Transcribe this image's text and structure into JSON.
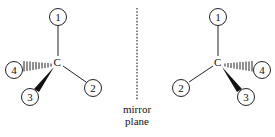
{
  "diagram": {
    "type": "enantiomer-mirror-diagram",
    "left_molecule": {
      "center_atom": "C",
      "substituents": [
        {
          "label": "1",
          "bond": "plain",
          "position": "top"
        },
        {
          "label": "2",
          "bond": "plain",
          "position": "lower-right"
        },
        {
          "label": "3",
          "bond": "wedge",
          "position": "lower-left"
        },
        {
          "label": "4",
          "bond": "hashed",
          "position": "left"
        }
      ]
    },
    "right_molecule": {
      "center_atom": "C",
      "substituents": [
        {
          "label": "1",
          "bond": "plain",
          "position": "top"
        },
        {
          "label": "2",
          "bond": "plain",
          "position": "lower-left"
        },
        {
          "label": "3",
          "bond": "wedge",
          "position": "lower-right"
        },
        {
          "label": "4",
          "bond": "hashed",
          "position": "right"
        }
      ]
    },
    "mirror": {
      "line_style": "dotted",
      "caption_line1": "mirror",
      "caption_line2": "plane"
    }
  }
}
